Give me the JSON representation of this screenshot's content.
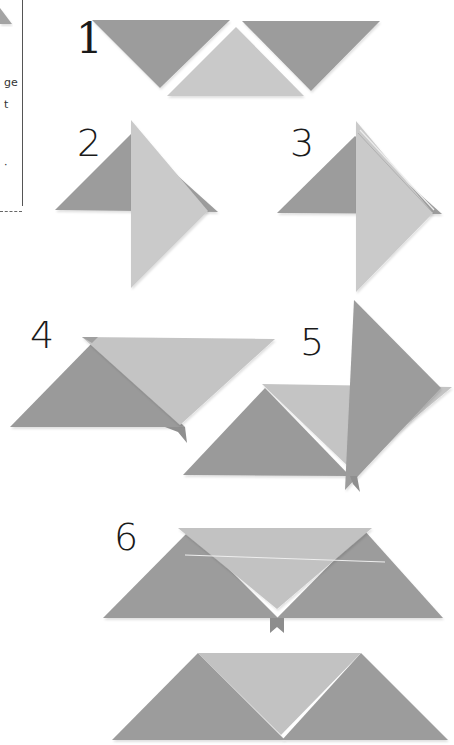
{
  "diagram": {
    "type": "origami-folding-steps",
    "colors": {
      "dark_paper": "#9b9b9b",
      "light_paper": "#c8c8c8",
      "shadow": "#e6e6e6",
      "text": "#1a1a1a",
      "frame_line": "#555555"
    },
    "side_panel": {
      "fragments": [
        {
          "text": "ge",
          "y": 82
        },
        {
          "text": "t",
          "y": 103
        },
        {
          "text": "·",
          "y": 165
        }
      ]
    },
    "steps": [
      {
        "label": "1",
        "description": "Three triangles laid side by side: two dark inverted, one light upright in middle"
      },
      {
        "label": "2",
        "description": "Light triangle folded over dark triangle, pointing right"
      },
      {
        "label": "3",
        "description": "Light triangle with fold line along upper edge over dark triangle"
      },
      {
        "label": "4",
        "description": "Light inverted triangle laid over dark triangle"
      },
      {
        "label": "5",
        "description": "Dark triangle inserted vertically over combined piece"
      },
      {
        "label": "6",
        "description": "Two dark triangles with light inverted triangle in middle, tab at bottom"
      },
      {
        "label": "",
        "description": "Finished trapezoid: two dark triangles flanking light inverted triangle"
      }
    ]
  }
}
